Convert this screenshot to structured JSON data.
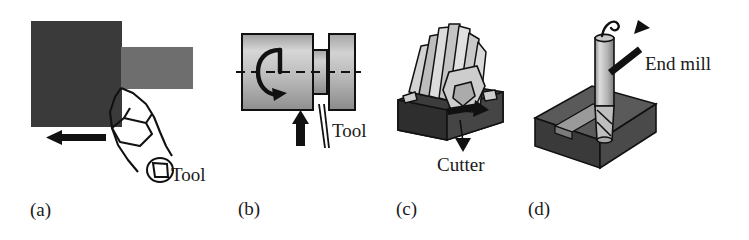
{
  "figure": {
    "type": "technical-illustration",
    "panel_count": 4
  },
  "panels": [
    {
      "id": "a",
      "caption": "(a)",
      "operation": "shaping-planing",
      "labels": [
        {
          "name": "tool-label",
          "text": "Tool"
        }
      ],
      "annotations": [
        {
          "name": "feed-arrow",
          "direction": "left"
        }
      ],
      "colors": {
        "workpiece": "#3a3a3a",
        "bar": "#6e6e6e",
        "outline": "#111111"
      }
    },
    {
      "id": "b",
      "caption": "(b)",
      "operation": "turning",
      "labels": [
        {
          "name": "tool-label",
          "text": "Tool"
        }
      ],
      "annotations": [
        {
          "name": "rotation-arrow",
          "direction": "rotational"
        },
        {
          "name": "feed-arrow",
          "direction": "up"
        },
        {
          "name": "centerline",
          "direction": "horizontal"
        }
      ],
      "colors": {
        "cylinder": "#b8b8b8",
        "outline": "#111111"
      }
    },
    {
      "id": "c",
      "caption": "(c)",
      "operation": "slab-milling",
      "labels": [
        {
          "name": "cutter-label",
          "text": "Cutter"
        }
      ],
      "annotations": [
        {
          "name": "feed-arrow",
          "direction": "right"
        }
      ],
      "colors": {
        "workpiece": "#3c3c3c",
        "cutter": "#c8c8c8",
        "outline": "#111111"
      }
    },
    {
      "id": "d",
      "caption": "(d)",
      "operation": "end-milling",
      "labels": [
        {
          "name": "end-mill-label",
          "text": "End mill"
        }
      ],
      "annotations": [
        {
          "name": "pointer-arrow",
          "direction": "up-right"
        }
      ],
      "colors": {
        "workpiece": "#4a4a4a",
        "tool": "#c0c0c0",
        "outline": "#111111"
      }
    }
  ]
}
